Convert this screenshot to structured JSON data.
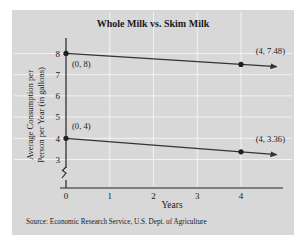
{
  "chart_data": {
    "type": "line",
    "title": "Whole Milk vs. Skim Milk",
    "xlabel": "Years",
    "ylabel_line1": "Average Consumption per",
    "ylabel_line2": "Person per Year (in gallons)",
    "xlim": [
      0,
      4.75
    ],
    "ylim": [
      2.6,
      8.35
    ],
    "xticks": [
      0,
      1,
      2,
      3,
      4
    ],
    "xticklabels": [
      "0",
      "1",
      "2",
      "3",
      "4"
    ],
    "yticks": [
      3,
      4,
      5,
      6,
      7,
      8
    ],
    "yticklabels": [
      "3",
      "4",
      "5",
      "6",
      "7",
      "8"
    ],
    "y_axis_break": true,
    "grid": true,
    "legend": "none",
    "series": [
      {
        "name": "Whole Milk",
        "x": [
          0,
          4
        ],
        "values": [
          8,
          7.48
        ],
        "markers": [
          {
            "x": 0,
            "y": 8
          },
          {
            "x": 4,
            "y": 7.48
          }
        ],
        "annotations": [
          {
            "text": "(0, 8)",
            "x": 0,
            "y": 8,
            "dx": 6,
            "dy": 14
          },
          {
            "text": "(4, 7.48)",
            "x": 4,
            "y": 7.48,
            "dx": -6,
            "dy": -10
          }
        ],
        "arrow_end": true
      },
      {
        "name": "Skim Milk",
        "x": [
          0,
          4
        ],
        "values": [
          4,
          3.36
        ],
        "markers": [
          {
            "x": 0,
            "y": 4
          },
          {
            "x": 4,
            "y": 3.36
          }
        ],
        "annotations": [
          {
            "text": "(0, 4)",
            "x": 0,
            "y": 4,
            "dx": 6,
            "dy": -9
          },
          {
            "text": "(4, 3.36)",
            "x": 4,
            "y": 3.36,
            "dx": -6,
            "dy": -10
          }
        ],
        "arrow_end": true
      }
    ]
  },
  "source": {
    "note": "Source: Economic Research Service, U.S. Dept. of Agriculture"
  },
  "colors": {
    "panel_background": "#d8d8d8",
    "figure_background": "#ffffff",
    "axis": "#262626",
    "series": "#333333",
    "gridline": "#f2f2f2",
    "text": "#1a1a1a"
  },
  "labels": {
    "title": "Whole Milk vs. Skim Milk",
    "x_axis_title": "Years",
    "y_axis_title_line1": "Average Consumption per",
    "y_axis_title_line2": "Person per Year (in gallons)"
  }
}
